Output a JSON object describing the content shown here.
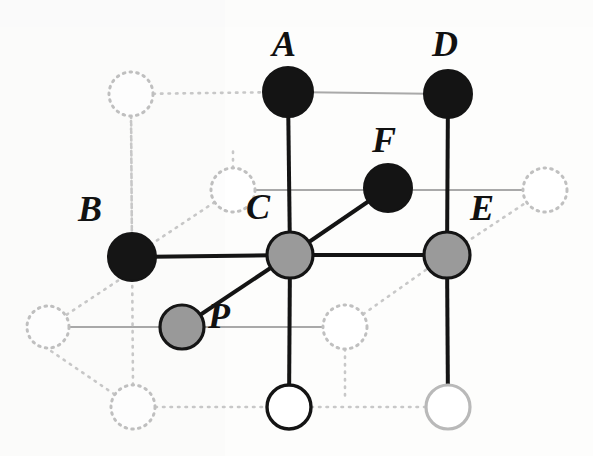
{
  "figure": {
    "type": "lattice-diagram",
    "width": 593,
    "height": 456,
    "background_color": "#fdfdfc"
  },
  "colors": {
    "solid_black": "#141414",
    "gray_fill": "#9a9a9a",
    "node_stroke": "#141414",
    "light_gray_stroke": "#b9b9b9",
    "dotted_stroke": "#c8c8c8",
    "solid_edge": "#141414",
    "gray_edge": "#a9a9a9"
  },
  "nodes": [
    {
      "id": "A",
      "label": "A",
      "x": 288,
      "y": 92,
      "r": 25,
      "style": "filled-black",
      "label_x": 272,
      "label_y": 26
    },
    {
      "id": "D",
      "label": "D",
      "x": 448,
      "y": 94,
      "r": 24,
      "style": "filled-black",
      "label_x": 432,
      "label_y": 26
    },
    {
      "id": "F",
      "label": "F",
      "x": 388,
      "y": 188,
      "r": 24,
      "style": "filled-black",
      "label_x": 372,
      "label_y": 122
    },
    {
      "id": "B",
      "label": "B",
      "x": 132,
      "y": 257,
      "r": 24,
      "style": "filled-black",
      "label_x": 78,
      "label_y": 191
    },
    {
      "id": "C",
      "label": "C",
      "x": 290,
      "y": 255,
      "r": 23,
      "style": "filled-gray",
      "label_x": 246,
      "label_y": 189
    },
    {
      "id": "E",
      "label": "E",
      "x": 447,
      "y": 255,
      "r": 23,
      "style": "filled-gray",
      "label_x": 470,
      "label_y": 190
    },
    {
      "id": "P",
      "label": "P",
      "x": 182,
      "y": 327,
      "r": 22,
      "style": "filled-gray",
      "label_x": 208,
      "label_y": 298
    },
    {
      "id": "W1",
      "label": "",
      "x": 289,
      "y": 407,
      "r": 22,
      "style": "hollow-dark",
      "label_x": 0,
      "label_y": 0
    },
    {
      "id": "W2",
      "label": "",
      "x": 448,
      "y": 407,
      "r": 22,
      "style": "hollow-light",
      "label_x": 0,
      "label_y": 0
    }
  ],
  "ghost_nodes": [
    {
      "id": "G1",
      "x": 131,
      "y": 94,
      "r": 22
    },
    {
      "id": "G2",
      "x": 233,
      "y": 190,
      "r": 22
    },
    {
      "id": "G3",
      "x": 545,
      "y": 190,
      "r": 22
    },
    {
      "id": "G4",
      "x": 48,
      "y": 327,
      "r": 21
    },
    {
      "id": "G5",
      "x": 345,
      "y": 327,
      "r": 22
    },
    {
      "id": "G6",
      "x": 133,
      "y": 407,
      "r": 22
    }
  ],
  "solid_edges": [
    {
      "from": "B",
      "to": "C"
    },
    {
      "from": "C",
      "to": "E"
    },
    {
      "from": "C",
      "to": "F"
    },
    {
      "from": "C",
      "to": "P"
    },
    {
      "from": "A",
      "to": "C"
    },
    {
      "from": "C",
      "to": "W1"
    },
    {
      "from": "D",
      "to": "E"
    },
    {
      "from": "E",
      "to": "W2"
    }
  ],
  "gray_edges": [
    {
      "from": "A",
      "to": "D"
    },
    {
      "from": "G2",
      "to": "G3"
    },
    {
      "from": "G4",
      "to": "G5"
    }
  ],
  "dotted_edges": [
    {
      "from": "G1",
      "to": "A"
    },
    {
      "from": "G1",
      "to": "B"
    },
    {
      "from": "B",
      "to": "G2"
    },
    {
      "from": "E",
      "to": "G3"
    },
    {
      "from": "G4",
      "to": "G1"
    },
    {
      "from": "G6",
      "to": "G4"
    },
    {
      "from": "G6",
      "to": "W1"
    },
    {
      "from": "W1",
      "to": "W2"
    },
    {
      "from": "G5",
      "to": "E"
    }
  ],
  "labels": {
    "A": "A",
    "B": "B",
    "C": "C",
    "D": "D",
    "E": "E",
    "F": "F",
    "P": "P"
  }
}
